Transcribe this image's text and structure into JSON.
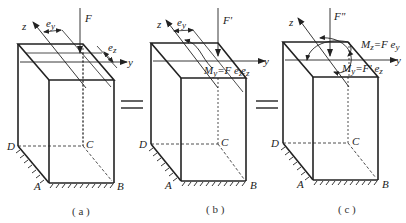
{
  "figure": {
    "panels": [
      {
        "id": "a",
        "caption": "( a )",
        "force_label": "F",
        "axis_z": "z",
        "axis_y": "y",
        "ecc_y": "e",
        "ecc_y_sub": "y",
        "ecc_z": "e",
        "ecc_z_sub": "z",
        "corner_A": "A",
        "corner_B": "B",
        "corner_C": "C",
        "corner_D": "D"
      },
      {
        "id": "b",
        "caption": "( b )",
        "force_label": "F'",
        "axis_z": "z",
        "axis_y": "y",
        "ecc_y": "e",
        "ecc_y_sub": "y",
        "ecc_z": "e",
        "ecc_z_sub": "z",
        "moment_label": "M",
        "moment_sub": "y",
        "moment_eq": "=F e",
        "moment_eq_sub": "z",
        "corner_A": "A",
        "corner_B": "B",
        "corner_C": "C",
        "corner_D": "D"
      },
      {
        "id": "c",
        "caption": "( c )",
        "force_label": "F\"",
        "axis_z": "z",
        "axis_y": "y",
        "ecc_z": "e",
        "ecc_z_sub": "z",
        "moment_z_label": "M",
        "moment_z_sub": "z",
        "moment_z_eq": "=F e",
        "moment_z_eq_sub": "y",
        "moment_y_label": "M",
        "moment_y_sub": "y",
        "moment_y_eq": "=F' e",
        "moment_y_eq_sub": "z",
        "corner_A": "A",
        "corner_B": "B",
        "corner_C": "C",
        "corner_D": "D"
      }
    ],
    "equals_symbols": [
      "=",
      "="
    ]
  }
}
